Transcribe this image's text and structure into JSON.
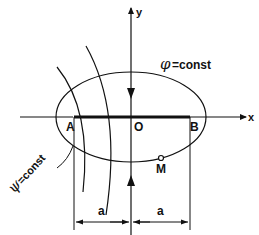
{
  "diagram": {
    "type": "elliptic-coordinates",
    "axes": {
      "x_label": "x",
      "y_label": "y",
      "origin_label": "O"
    },
    "points": [
      {
        "id": "A",
        "label": "A"
      },
      {
        "id": "O",
        "label": "O"
      },
      {
        "id": "B",
        "label": "B"
      },
      {
        "id": "M",
        "label": "M"
      }
    ],
    "curves": {
      "ellipse_label_symbol": "φ",
      "ellipse_label_text": "=const",
      "hyperbola_label_symbol": "ψ",
      "hyperbola_label_text": "=const"
    },
    "dimensions": [
      {
        "label": "a"
      },
      {
        "label": "a"
      }
    ],
    "colors": {
      "ink": "#111111",
      "background": "#ffffff"
    }
  }
}
